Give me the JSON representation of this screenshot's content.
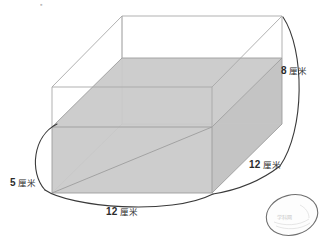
{
  "figure": {
    "type": "geometry-diagram",
    "unit_text": "厘米",
    "colors": {
      "water_fill": "#cfcfcf",
      "box_edge": "#9a9a9a",
      "hidden_edge": "#bfbfbf",
      "bracket_line": "#3a3a3a",
      "label_text": "#2b2b2b",
      "egg_outline": "#6f6f6f",
      "background": "#ffffff"
    },
    "labels": [
      {
        "id": "height-8",
        "number": "8",
        "unit": "厘米",
        "meaning": "container height"
      },
      {
        "id": "depth-12",
        "number": "12",
        "unit": "厘米",
        "meaning": "container depth"
      },
      {
        "id": "left-5",
        "number": "5",
        "unit": "厘米",
        "meaning": "water depth"
      },
      {
        "id": "width-12",
        "number": "12",
        "unit": "厘米",
        "meaning": "container width"
      }
    ],
    "egg": {
      "present": true,
      "label": "egg"
    },
    "top_mark": "▪",
    "watermark": "学科网"
  }
}
